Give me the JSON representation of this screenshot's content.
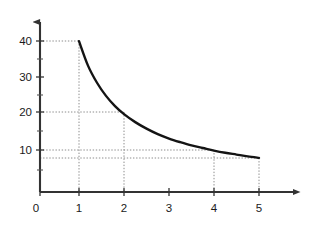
{
  "chart_data": {
    "type": "line",
    "title": "",
    "subtitle": "",
    "xlabel": "",
    "ylabel": "",
    "xlim": [
      0,
      5.9
    ],
    "ylim": [
      0,
      44
    ],
    "grid": false,
    "legend": null,
    "x_ticks": [
      "0",
      "1",
      "2",
      "3",
      "4",
      "5"
    ],
    "x_tick_values": [
      0,
      1,
      2,
      3,
      4,
      5
    ],
    "y_ticks": [
      "10",
      "20",
      "30",
      "40"
    ],
    "y_tick_values": [
      10,
      20,
      30,
      40
    ],
    "y_minor_tick_values": [
      5,
      15,
      25,
      35
    ],
    "series": [
      {
        "name": "curve",
        "color": "#141414",
        "x": [
          1,
          1.2,
          1.4,
          1.6,
          1.8,
          2,
          2.25,
          2.5,
          2.75,
          3,
          3.25,
          3.5,
          3.75,
          4,
          4.25,
          4.5,
          4.75,
          5
        ],
        "values": [
          40,
          33.3,
          28.6,
          25,
          22.2,
          20,
          17.8,
          16,
          14.5,
          13.3,
          12.3,
          11.4,
          10.7,
          10,
          9.4,
          8.9,
          8.4,
          8
        ]
      }
    ],
    "annotations": [
      {
        "kind": "dotted-guide",
        "x": 1,
        "y": 40,
        "label": "(1, 40)"
      },
      {
        "kind": "dotted-guide",
        "x": 2,
        "y": 20,
        "label": "(2, 20)"
      },
      {
        "kind": "dotted-guide",
        "x": 4,
        "y": 10,
        "label": "(4, 10)"
      },
      {
        "kind": "dotted-guide",
        "x": 5,
        "y": 8,
        "label": "(5, 8)"
      }
    ],
    "axis_color": "#333333",
    "guide_color": "#8c8c8c",
    "background": "#ffffff"
  },
  "axes": {
    "x_axis_name": "x-axis",
    "y_axis_name": "y-axis",
    "x_arrow": "arrow-right",
    "y_arrow": "arrow-up"
  }
}
